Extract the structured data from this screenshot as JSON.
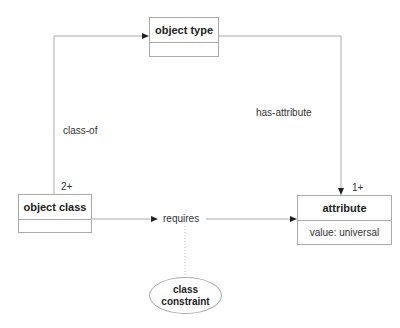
{
  "nodes": {
    "object_type": {
      "title": "object type",
      "body": ""
    },
    "object_class": {
      "title": "object class",
      "body": ""
    },
    "attribute": {
      "title": "attribute",
      "body": "value: universal"
    },
    "class_constraint": {
      "line1": "class",
      "line2": "constraint"
    }
  },
  "edges": {
    "class_of": {
      "label": "class-of",
      "multiplicity": "2+"
    },
    "has_attribute": {
      "label": "has-attribute",
      "multiplicity": "1+"
    },
    "requires": {
      "label": "requires"
    }
  },
  "colors": {
    "line": "#aaaaaa",
    "arrow": "#222222",
    "text": "#222222"
  }
}
